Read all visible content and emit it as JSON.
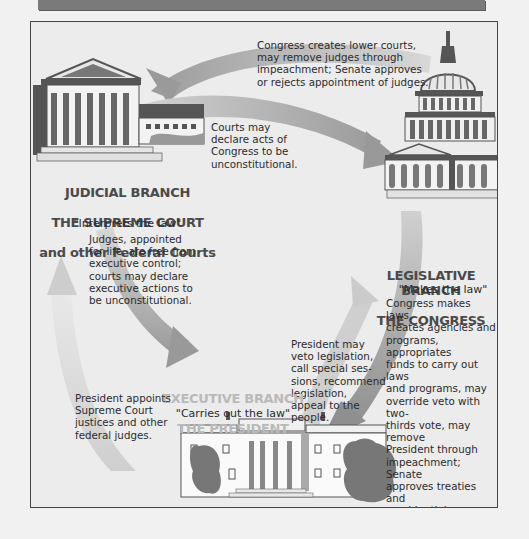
{
  "diagram": {
    "branches": {
      "judicial": {
        "heading_lines": [
          "JUDICIAL BRANCH",
          "THE SUPREME COURT",
          "and other Federal Courts"
        ],
        "motto": "\"Interprets the law\"",
        "description": "Judges, appointed\nfor life, are free from\nexecutive control;\ncourts may declare\nexecutive actions to\nbe unconstitutional.",
        "icon": "supreme-court-building"
      },
      "legislative": {
        "heading_lines": [
          "LEGISLATIVE BRANCH",
          "THE CONGRESS"
        ],
        "motto": "\"Makes the law\"",
        "description": "Congress makes laws,\ncreates agencies and\nprograms, appropriates\nfunds to carry out laws\nand programs, may\noverride veto with two-\nthirds vote, may remove\nPresident through\nimpeachment; Senate\napproves treaties and\npresidential appointments.",
        "icon": "capitol-building"
      },
      "executive": {
        "heading_lines": [
          "EXECUTIVE BRANCH",
          "THE PRESIDENT"
        ],
        "motto": "\"Carries out the law\"",
        "icon": "white-house"
      }
    },
    "arrows": {
      "congress_to_courts": "Congress creates lower courts,\nmay remove judges through\nimpeachment; Senate approves\nor rejects appointment of judges.",
      "courts_to_congress": "Courts may\ndeclare acts of\nCongress to be\nunconstitutional.",
      "president_to_courts": "President appoints\nSupreme Court\njustices and other\nfederal judges.",
      "president_to_congress": "President may\nveto legislation,\ncall special ses-\nsions, recommend\nlegislation,\nappeal to the\npeople."
    },
    "colors": {
      "background": "#f1f1f1",
      "panel": "#ececec",
      "arrow_dark": "#9a9a9a",
      "arrow_light": "#d4d4d4",
      "building_dark": "#555555",
      "exec_heading": "#b9b9b9"
    }
  }
}
